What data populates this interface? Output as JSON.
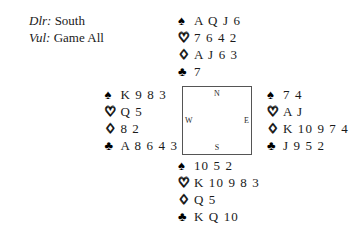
{
  "deal_info": {
    "dealer_label": "Dlr:",
    "dealer_value": "South",
    "vulnerability_label": "Vul:",
    "vulnerability_value": "Game All"
  },
  "compass": {
    "north": "N",
    "west": "W",
    "east": "E",
    "south": "S"
  },
  "suit_symbols": {
    "spade": "♠",
    "heart": "♡",
    "diamond": "♢",
    "club": "♣"
  },
  "hands": {
    "north": {
      "position": "North",
      "spades": "A Q J 6",
      "hearts": "7 6 4 2",
      "diamonds": "A J 6 3",
      "clubs": "7"
    },
    "west": {
      "position": "West",
      "spades": "K 9 8 3",
      "hearts": "Q 5",
      "diamonds": "8 2",
      "clubs": "A 8 6 4 3"
    },
    "east": {
      "position": "East",
      "spades": "7 4",
      "hearts": "A J",
      "diamonds": "K 10 9 7 4",
      "clubs": "J 9 5 2"
    },
    "south": {
      "position": "South",
      "spades": "10 5 2",
      "hearts": "K 10 9 8 3",
      "diamonds": "Q 5",
      "clubs": "K Q 10"
    }
  },
  "colors": {
    "ink": "#1a1a1a",
    "box_border": "#555555",
    "background": "#ffffff"
  }
}
